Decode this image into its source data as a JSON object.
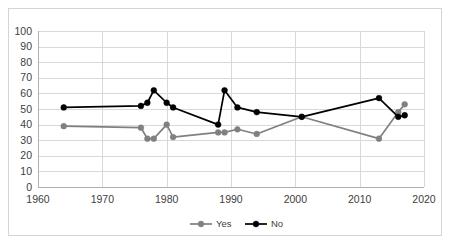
{
  "chart_data": {
    "type": "line",
    "title": "",
    "subtitle": "",
    "xlabel": "",
    "ylabel": "",
    "xlim": [
      1960,
      2020
    ],
    "ylim": [
      0,
      100
    ],
    "xticks": [
      1960,
      1970,
      1980,
      1990,
      2000,
      2010,
      2020
    ],
    "yticks": [
      0,
      10,
      20,
      30,
      40,
      50,
      60,
      70,
      80,
      90,
      100
    ],
    "grid": true,
    "legend_position": "bottom-center",
    "legend_entries": [
      "Yes",
      "No"
    ],
    "colors": {
      "yes": "#808080",
      "no": "#000000",
      "gridline": "#d9d9d9",
      "axis": "#b0b0b0",
      "border": "#d4d4d4",
      "text": "#404040",
      "background": "#ffffff"
    },
    "series": [
      {
        "name": "Yes",
        "color": "#808080",
        "marker": "circle",
        "x": [
          1964,
          1976,
          1977,
          1978,
          1980,
          1981,
          1988,
          1989,
          1991,
          1994,
          2001,
          2013,
          2016,
          2017
        ],
        "values": [
          39,
          38,
          31,
          31,
          40,
          32,
          35,
          35,
          37,
          34,
          45,
          31,
          48,
          53
        ]
      },
      {
        "name": "No",
        "color": "#000000",
        "marker": "circle",
        "x": [
          1964,
          1976,
          1977,
          1978,
          1980,
          1981,
          1988,
          1989,
          1991,
          1994,
          2001,
          2013,
          2016,
          2017
        ],
        "values": [
          51,
          52,
          54,
          62,
          54,
          51,
          40,
          62,
          51,
          48,
          45,
          57,
          45,
          46
        ]
      }
    ]
  },
  "axes": {
    "y_tick_labels": [
      "100",
      "90",
      "80",
      "70",
      "60",
      "50",
      "40",
      "30",
      "20",
      "10",
      "0"
    ],
    "x_tick_labels": [
      "1960",
      "1970",
      "1980",
      "1990",
      "2000",
      "2010",
      "2020"
    ]
  },
  "legend": {
    "items": [
      {
        "label": "Yes",
        "color": "#808080"
      },
      {
        "label": "No",
        "color": "#000000"
      }
    ]
  }
}
